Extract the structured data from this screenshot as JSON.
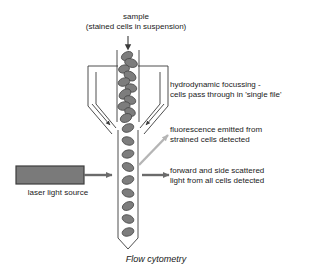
{
  "figure": {
    "caption": "Flow cytometry",
    "background_color": "#ffffff"
  },
  "labels": {
    "sample_line1": "sample",
    "sample_line2": "(stained cells in suspension)",
    "hydrodynamic_line1": "hydrodynamic focussing -",
    "hydrodynamic_line2": "cells pass through in 'single file'",
    "fluorescence_line1": "fluorescence emitted from",
    "fluorescence_line2": "strained cells detected",
    "scatter_line1": "forward and side scattered",
    "scatter_line2": "light from all cells detected",
    "laser_source": "laser light source"
  },
  "colors": {
    "outline": "#3a3a3a",
    "cell_fill": "#7d7d7d",
    "cell_stroke": "#4a4a4a",
    "laser_box_fill": "#7a7a7a",
    "laser_box_stroke": "#3d3d3d",
    "arrow_dark": "#6b6b6b",
    "arrow_light": "#b5b5b5",
    "text": "#1a1a1a"
  },
  "components": {
    "sample_inlet_arrow": "down-arrow",
    "sheath_chamber": "hydrodynamic-focussing-chamber",
    "flow_tube": "single-file-flow-tube",
    "laser_box": "laser-light-source-box",
    "laser_beam_arrow": "right-arrow",
    "fluorescence_arrow": "diagonal-up-right-arrow",
    "scatter_arrow": "right-arrow",
    "sheath_inlet_arrow_left": "down-right-arrow",
    "sheath_inlet_arrow_right": "down-left-arrow"
  },
  "cells": {
    "suspension_count": 14,
    "single_file_count": 9,
    "note_region_upper": "clustered stained cells in suspension",
    "note_region_lower": "cells aligned in single file"
  }
}
